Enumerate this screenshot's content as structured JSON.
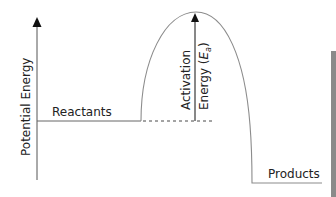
{
  "diagram": {
    "type": "energy-profile",
    "y_axis_label": "Potential Energy",
    "reactants_label": "Reactants",
    "products_label": "Products",
    "activation_label_line1": "Activation",
    "activation_label_line2_prefix": "Energy (",
    "activation_symbol": "E",
    "activation_subscript": "a",
    "activation_label_line2_suffix": ")",
    "colors": {
      "curve": "#8c8c8c",
      "axis": "#333333",
      "arrow": "#111111",
      "side_bar": "#8a8a8a"
    }
  }
}
